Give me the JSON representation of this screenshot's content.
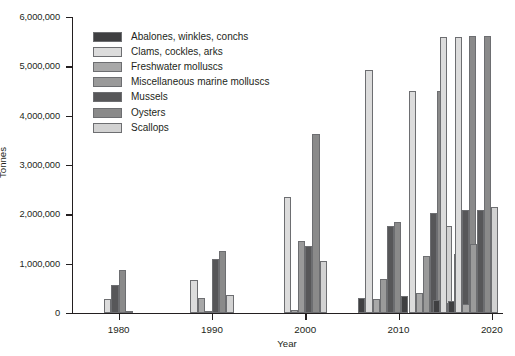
{
  "chart_data": {
    "type": "bar",
    "title": "",
    "subtitle": "",
    "xlabel": "Year",
    "ylabel": "Tonnes",
    "xlim": [
      1975,
      2020
    ],
    "ylim": [
      0,
      6000000
    ],
    "ytick_labels": [
      "0",
      "1,000,000",
      "2,000,000",
      "3,000,000",
      "4,000,000",
      "5,000,000",
      "6,000,000"
    ],
    "ytick_values": [
      0,
      1000000,
      2000000,
      3000000,
      4000000,
      5000000,
      6000000
    ],
    "xtick_labels": [
      "1980",
      "1990",
      "2000",
      "2010",
      "2020"
    ],
    "xtick_values": [
      1980,
      1990,
      2000,
      2010,
      2020
    ],
    "grid": false,
    "legend_position": "upper-left-inside",
    "categories": [
      1980,
      1990,
      2000,
      2008,
      2013,
      2016,
      2018
    ],
    "series": [
      {
        "name": "Abalones, winkles, conchs",
        "color": "#3f3f41",
        "values": [
          0,
          0,
          0,
          310000,
          350000,
          270000,
          250000
        ]
      },
      {
        "name": "Clams, cockles, arks",
        "color": "#dcdcdc",
        "values": [
          280000,
          660000,
          2350000,
          4920000,
          4500000,
          5590000,
          5600000
        ]
      },
      {
        "name": "Freshwater molluscs",
        "color": "#a8a8a8",
        "values": [
          0,
          310000,
          60000,
          290000,
          400000,
          200000,
          190000
        ]
      },
      {
        "name": "Miscellaneous marine molluscs",
        "color": "#9a9a9a",
        "values": [
          0,
          50000,
          1450000,
          680000,
          1150000,
          1200000,
          1390000
        ]
      },
      {
        "name": "Mussels",
        "color": "#575759",
        "values": [
          570000,
          1100000,
          1350000,
          1770000,
          2020000,
          2080000,
          2080000
        ]
      },
      {
        "name": "Oysters",
        "color": "#8a8a8a",
        "values": [
          880000,
          1260000,
          3620000,
          1850000,
          4510000,
          5620000,
          5620000
        ]
      },
      {
        "name": "Scallops",
        "color": "#d2d2d2",
        "values": [
          50000,
          370000,
          1050000,
          0,
          1770000,
          0,
          2150000
        ]
      }
    ]
  },
  "legend": {
    "items": [
      {
        "label": "Abalones, winkles, conchs",
        "color": "#3f3f41"
      },
      {
        "label": "Clams, cockles, arks",
        "color": "#dcdcdc"
      },
      {
        "label": "Freshwater molluscs",
        "color": "#a8a8a8"
      },
      {
        "label": "Miscellaneous marine molluscs",
        "color": "#9a9a9a"
      },
      {
        "label": "Mussels",
        "color": "#575759"
      },
      {
        "label": "Oysters",
        "color": "#8a8a8a"
      },
      {
        "label": "Scallops",
        "color": "#d2d2d2"
      }
    ]
  }
}
